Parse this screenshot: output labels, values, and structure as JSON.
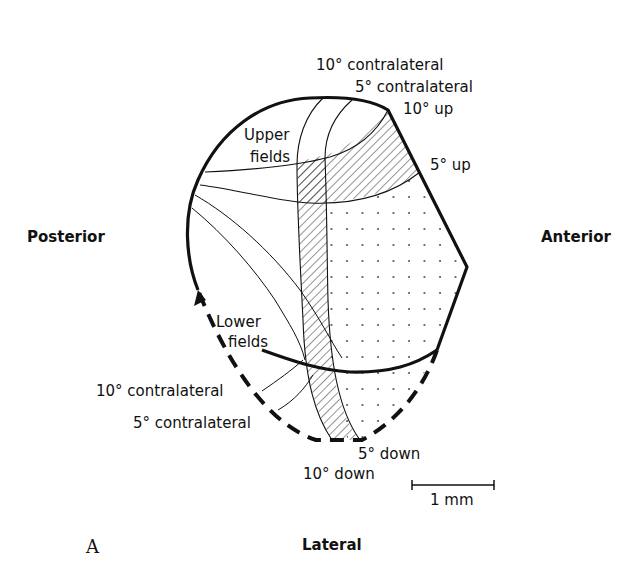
{
  "figure": {
    "panel_label": "A",
    "orientation": {
      "left": "Posterior",
      "right": "Anterior",
      "bottom": "Lateral"
    },
    "region_labels": {
      "upper_fields": [
        "Upper",
        "fields"
      ],
      "lower_fields": [
        "Lower",
        "fields"
      ]
    },
    "upper_isolines": {
      "contra_10": "10° contralateral",
      "contra_5": "5° contralateral",
      "up_10": "10° up",
      "up_5": "5° up"
    },
    "lower_isolines": {
      "contra_10": "10° contralateral",
      "contra_5": "5° contralateral",
      "down_5": "5° down",
      "down_10": "10° down"
    },
    "scale_bar": {
      "label": "1 mm"
    },
    "colors": {
      "ink": "#111111",
      "background": "#ffffff"
    }
  }
}
